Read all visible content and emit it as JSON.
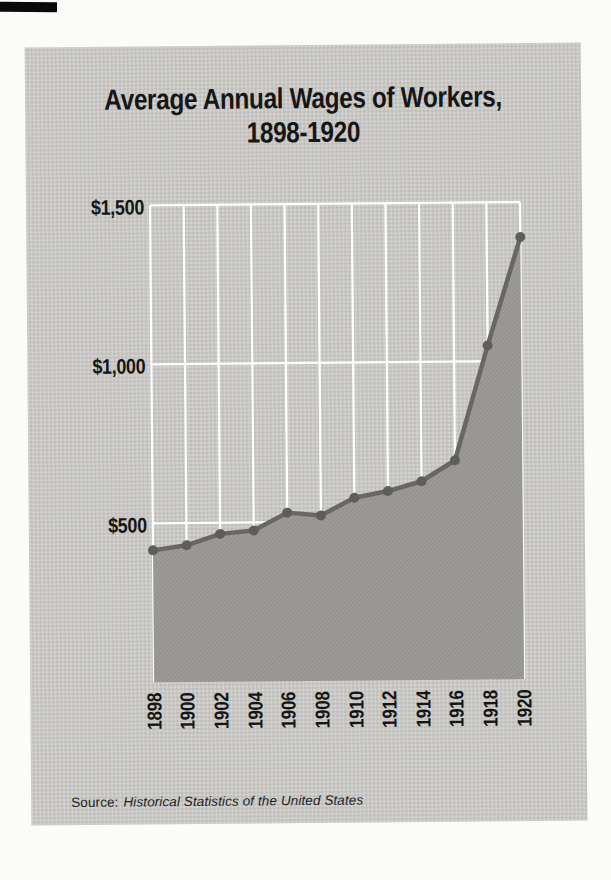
{
  "title": {
    "line1": "Average Annual Wages of Workers,",
    "line2": "1898-1920"
  },
  "source": {
    "prefix": "Source:",
    "citation": "Historical Statistics of the United States"
  },
  "colors": {
    "page_bg": "#fbfbf9",
    "panel_bg": "#c8c7c4",
    "gridline": "#ffffff",
    "area_fill": "#9c9b98",
    "line": "#686764",
    "point": "#5e5d5b",
    "text": "#151515",
    "artifact": "#0a0a0a"
  },
  "chart_data": {
    "type": "area",
    "title": "Average Annual Wages of Workers, 1898-1920",
    "xlabel": "",
    "ylabel": "",
    "categories": [
      "1898",
      "1900",
      "1902",
      "1904",
      "1906",
      "1908",
      "1910",
      "1912",
      "1914",
      "1916",
      "1918",
      "1920"
    ],
    "x": [
      1898,
      1900,
      1902,
      1904,
      1906,
      1908,
      1910,
      1912,
      1914,
      1916,
      1918,
      1920
    ],
    "values": [
      415,
      430,
      465,
      475,
      530,
      520,
      575,
      595,
      625,
      690,
      1050,
      1390
    ],
    "series_name": "Average annual wage (dollars)",
    "ylim": [
      0,
      1500
    ],
    "yticks": [
      {
        "value": 500,
        "label": "$500"
      },
      {
        "value": 1000,
        "label": "$1,000"
      },
      {
        "value": 1500,
        "label": "$1,500"
      }
    ],
    "grid": true,
    "gridlines": "white vertical line per year and horizontal line per y-tick, drawn behind the filled area",
    "legend": "none"
  }
}
